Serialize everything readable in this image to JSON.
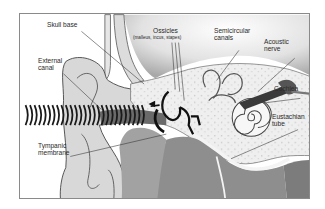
{
  "figure": {
    "labels": {
      "skull_base": "Skull base",
      "external_canal_1": "External",
      "external_canal_2": "canal",
      "ossicles": "Ossicles",
      "ossicles_sub": "(malleus, incus, stapes)",
      "semicircular_1": "Semicircular",
      "semicircular_2": "canals",
      "acoustic_1": "Acoustic",
      "acoustic_2": "nerve",
      "cochlea": "Cochlea",
      "eustachian_1": "Eustachian",
      "eustachian_2": "tube",
      "tympanic_1": "Tympanic",
      "tympanic_2": "membrane"
    },
    "colors": {
      "frame": "#8a8a8a",
      "outer_tissue": "#d4d4d4",
      "bone": "#ececec",
      "dark_tissue": "#8e8e8e",
      "waves": "#1a1a1a"
    }
  }
}
